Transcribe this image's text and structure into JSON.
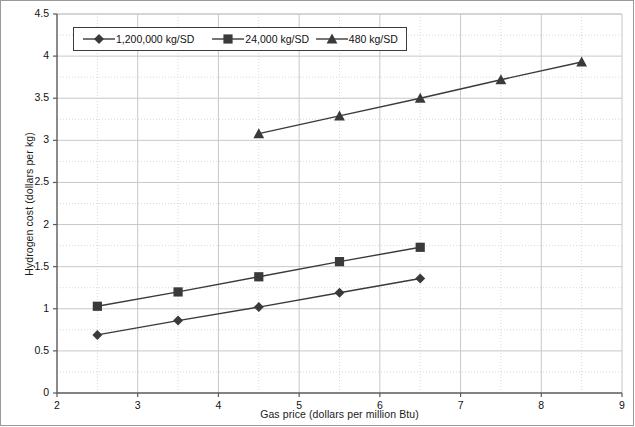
{
  "chart_data": {
    "type": "line",
    "title": "",
    "xlabel": "Gas price (dollars per million Btu)",
    "ylabel": "Hydrogen cost (dollars per kg)",
    "xlim": [
      2,
      9
    ],
    "ylim": [
      0,
      4.5
    ],
    "xticks": [
      "2",
      "3",
      "4",
      "5",
      "6",
      "7",
      "8",
      "9"
    ],
    "yticks": [
      "0",
      "0.5",
      "1",
      "1.5",
      "2",
      "2.5",
      "3",
      "3.5",
      "4",
      "4.5"
    ],
    "grid": true,
    "legend_position": "top-left-inside",
    "series": [
      {
        "name": "1,200,000 kg/SD",
        "marker": "diamond",
        "color": "#3a3a3a",
        "x": [
          2.5,
          3.5,
          4.5,
          5.5,
          6.5
        ],
        "values": [
          0.69,
          0.86,
          1.02,
          1.19,
          1.36
        ]
      },
      {
        "name": "24,000 kg/SD",
        "marker": "square",
        "color": "#3a3a3a",
        "x": [
          2.5,
          3.5,
          4.5,
          5.5,
          6.5
        ],
        "values": [
          1.03,
          1.2,
          1.38,
          1.56,
          1.73
        ]
      },
      {
        "name": "480 kg/SD",
        "marker": "triangle",
        "color": "#3a3a3a",
        "x": [
          4.5,
          5.5,
          6.5,
          7.5,
          8.5
        ],
        "values": [
          3.08,
          3.29,
          3.5,
          3.72,
          3.93
        ]
      }
    ]
  },
  "legend": {
    "items": [
      {
        "label": "1,200,000 kg/SD",
        "marker": "diamond"
      },
      {
        "label": "24,000 kg/SD",
        "marker": "square"
      },
      {
        "label": "480 kg/SD",
        "marker": "triangle"
      }
    ]
  },
  "colors": {
    "series": "#3a3a3a",
    "grid_major": "#c8c8c8",
    "grid_minor": "#d8d8d8",
    "axis": "#5a5a5a",
    "frame": "#9a9a9a"
  }
}
